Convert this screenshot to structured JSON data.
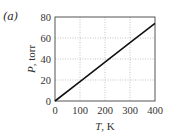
{
  "panel_label": "(a)",
  "chart_data": {
    "type": "line",
    "title": "",
    "xlabel": "T, K",
    "ylabel": "P, torr",
    "xlim": [
      0,
      400
    ],
    "ylim": [
      0,
      80
    ],
    "xticks": [
      0,
      100,
      200,
      300,
      400
    ],
    "yticks": [
      0,
      20,
      40,
      60,
      80
    ],
    "grid": true,
    "series": [
      {
        "name": "P vs T",
        "x": [
          0,
          100,
          200,
          300,
          400
        ],
        "y": [
          0,
          18.5,
          37,
          55.5,
          74
        ],
        "color": "#111111"
      }
    ]
  },
  "axis": {
    "xlabel_var": "T",
    "xlabel_unit": ", K",
    "ylabel_var": "P",
    "ylabel_unit": ", torr",
    "xtick_labels": [
      "0",
      "100",
      "200",
      "300",
      "400"
    ],
    "ytick_labels": [
      "0",
      "20",
      "40",
      "60",
      "80"
    ]
  }
}
